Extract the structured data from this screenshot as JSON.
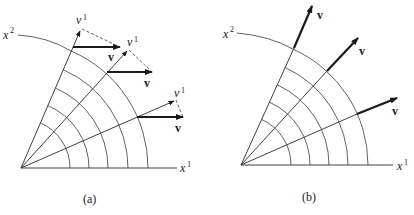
{
  "figure": {
    "panels": [
      {
        "id": "a",
        "caption": "(a)",
        "axis_x_label": "x",
        "axis_x_sup": "1",
        "axis_y_label": "x",
        "axis_y_sup": "2",
        "component_label": "v",
        "component_sup": "1",
        "vector_label": "v",
        "description": "Polar coordinate grid; constant vector field v drawn horizontally at three points, with its v^1 (radial) component shown along each ray and dashed projection lines."
      },
      {
        "id": "b",
        "caption": "(b)",
        "axis_x_label": "x",
        "axis_x_sup": "1",
        "axis_y_label": "x",
        "axis_y_sup": "2",
        "vector_label": "v",
        "description": "Polar coordinate grid; vector field v drawn radially outward along three rays."
      }
    ],
    "colors": {
      "ink": "#1a1a1a",
      "background": "#ffffff"
    }
  }
}
